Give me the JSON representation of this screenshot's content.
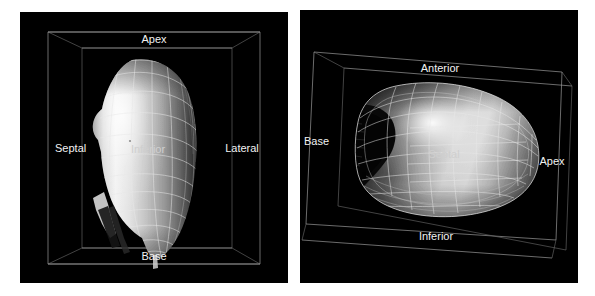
{
  "figure": {
    "background_color": "#ffffff",
    "panel_background_color": "#000000",
    "label_color": "#f2f2f2",
    "wireframe_color": "#e8e8e8",
    "box_color": "#9a9a9a"
  },
  "panels": [
    {
      "id": "left",
      "name": "left-ventricle-lateral-view",
      "labels": {
        "top": "Apex",
        "left": "Septal",
        "center": "Inferior",
        "right": "Lateral",
        "bottom": "Base"
      }
    },
    {
      "id": "right",
      "name": "left-ventricle-long-axis-view",
      "labels": {
        "top": "Anterior",
        "left": "Base",
        "center": "Septal",
        "right": "Apex",
        "bottom": "Inferior"
      }
    }
  ]
}
